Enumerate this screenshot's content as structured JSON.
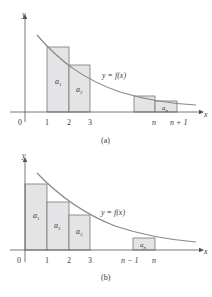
{
  "colors": {
    "axis": "#555555",
    "curve": "#8a8a8a",
    "bar_fill": "#e4e4e6",
    "bar_stroke": "#777777",
    "text": "#3a3a3a"
  },
  "panels": [
    {
      "caption": "(a)",
      "y_axis_label": "y",
      "x_axis_label": "x",
      "origin_label": "0",
      "curve_label": "y = f(x)",
      "ticks": [
        "1",
        "2",
        "3",
        "n",
        "n + 1"
      ],
      "bars": [
        {
          "label": "a1",
          "from": "1",
          "to": "2"
        },
        {
          "label": "a2",
          "from": "2",
          "to": "3"
        },
        {
          "label": "",
          "from": "n-1",
          "to": "n"
        },
        {
          "label": "an",
          "from": "n",
          "to": "n+1"
        }
      ]
    },
    {
      "caption": "(b)",
      "y_axis_label": "y",
      "x_axis_label": "x",
      "origin_label": "0",
      "curve_label": "y = f(x)",
      "ticks": [
        "1",
        "2",
        "3",
        "n − 1",
        "n"
      ],
      "bars": [
        {
          "label": "a1",
          "from": "0",
          "to": "1"
        },
        {
          "label": "a2",
          "from": "1",
          "to": "2"
        },
        {
          "label": "a3",
          "from": "2",
          "to": "3"
        },
        {
          "label": "an",
          "from": "n-1",
          "to": "n"
        }
      ]
    }
  ]
}
